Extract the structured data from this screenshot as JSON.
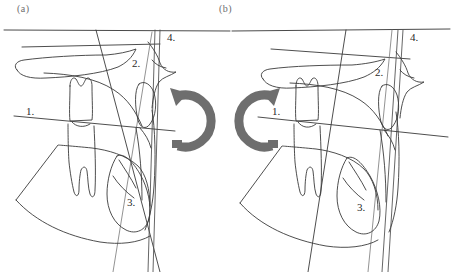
{
  "figure": {
    "type": "cephalometric-tracing-pair",
    "background_color": "#ffffff",
    "line_color": "#3a3a3a",
    "arrow_color": "#6e6e6e",
    "caption_color": "#6d6d6d"
  },
  "panels": [
    {
      "id": "a",
      "caption": "(a)",
      "rotation_arrow": {
        "name": "clockwise-rotation-arrow",
        "direction": "clockwise",
        "color": "#6e6e6e"
      },
      "labels": [
        {
          "key": "1",
          "text": "1.",
          "x": 26,
          "y": 105
        },
        {
          "key": "2",
          "text": "2.",
          "x": 132,
          "y": 57
        },
        {
          "key": "3",
          "text": "3.",
          "x": 127,
          "y": 196
        },
        {
          "key": "4",
          "text": "4.",
          "x": 167,
          "y": 31
        }
      ]
    },
    {
      "id": "b",
      "caption": "(b)",
      "rotation_arrow": {
        "name": "counterclockwise-rotation-arrow",
        "direction": "counterclockwise",
        "color": "#6e6e6e"
      },
      "labels": [
        {
          "key": "1",
          "text": "1.",
          "x": 272,
          "y": 105
        },
        {
          "key": "2",
          "text": "2.",
          "x": 375,
          "y": 66
        },
        {
          "key": "3",
          "text": "3.",
          "x": 357,
          "y": 201
        },
        {
          "key": "4",
          "text": "4.",
          "x": 410,
          "y": 31
        }
      ]
    }
  ],
  "legend_keys": {
    "1": "occlusal-plane-line",
    "2": "pterygomaxillary-fissure",
    "3": "impacted-third-molar",
    "4": "vertical-reference-lines"
  }
}
